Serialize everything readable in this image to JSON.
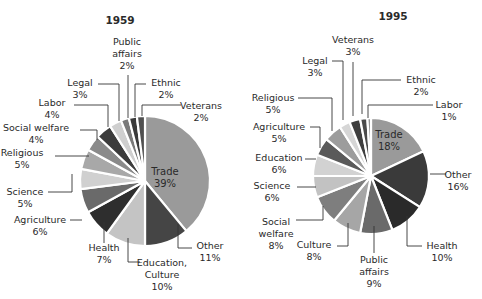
{
  "chart_data": [
    {
      "type": "pie",
      "title": "1959",
      "center": [
        145,
        181
      ],
      "radius": 65,
      "start_angle_deg": 0,
      "direction": "clockwise",
      "slices": [
        {
          "label": "Trade",
          "value": 39,
          "color": "#9a9a9a",
          "inside": true
        },
        {
          "label": "Other",
          "value": 11,
          "color": "#454545"
        },
        {
          "label": "Education, Culture",
          "value": 10,
          "color": "#c4c4c4"
        },
        {
          "label": "Health",
          "value": 7,
          "color": "#2e2e2e"
        },
        {
          "label": "Agriculture",
          "value": 6,
          "color": "#6a6a6a"
        },
        {
          "label": "Science",
          "value": 5,
          "color": "#d0d0d0"
        },
        {
          "label": "Religious",
          "value": 5,
          "color": "#a8a8a8"
        },
        {
          "label": "Social welfare",
          "value": 4,
          "color": "#8a8a8a"
        },
        {
          "label": "Labor",
          "value": 4,
          "color": "#3c3c3c"
        },
        {
          "label": "Legal",
          "value": 3,
          "color": "#cfcfcf"
        },
        {
          "label": "Public affairs",
          "value": 2,
          "color": "#7a7a7a"
        },
        {
          "label": "Ethnic",
          "value": 2,
          "color": "#3a3a3a"
        },
        {
          "label": "Veterans",
          "value": 2,
          "color": "#505050"
        }
      ],
      "labels": [
        {
          "text": [
            "Trade",
            "39%"
          ],
          "x": 165,
          "y": 175,
          "anchor": "middle",
          "inside": true
        },
        {
          "text": [
            "Other",
            "11%"
          ],
          "x": 210,
          "y": 249,
          "anchor": "middle",
          "line": [
            [
              192,
              248
            ],
            [
              178,
              248
            ],
            [
              178,
              224
            ]
          ]
        },
        {
          "text": [
            "Education,",
            "Culture",
            "10%"
          ],
          "x": 162,
          "y": 266,
          "anchor": "middle",
          "line": [
            [
              140,
              262
            ],
            [
              128,
              262
            ],
            [
              128,
              238
            ]
          ]
        },
        {
          "text": [
            "Health",
            "7%"
          ],
          "x": 104,
          "y": 251,
          "anchor": "middle",
          "line": [
            [
              104,
              243
            ],
            [
              104,
              222
            ]
          ]
        },
        {
          "text": [
            "Agriculture",
            "6%"
          ],
          "x": 40,
          "y": 223,
          "anchor": "middle",
          "line": [
            [
              70,
              220
            ],
            [
              82,
              220
            ]
          ]
        },
        {
          "text": [
            "Science",
            "5%"
          ],
          "x": 25,
          "y": 195,
          "anchor": "middle",
          "line": [
            [
              48,
              192
            ],
            [
              72,
              192
            ],
            [
              72,
              174
            ]
          ]
        },
        {
          "text": [
            "Religious",
            "5%"
          ],
          "x": 22,
          "y": 156,
          "anchor": "middle",
          "line": [
            [
              55,
              156
            ],
            [
              89,
              156
            ]
          ]
        },
        {
          "text": [
            "Social welfare",
            "4%"
          ],
          "x": 36,
          "y": 131,
          "anchor": "middle",
          "line": [
            [
              80,
              130
            ],
            [
              97,
              130
            ],
            [
              97,
              140
            ]
          ]
        },
        {
          "text": [
            "Labor",
            "4%"
          ],
          "x": 52,
          "y": 106,
          "anchor": "middle",
          "line": [
            [
              74,
              105
            ],
            [
              108,
              105
            ],
            [
              108,
              127
            ]
          ]
        },
        {
          "text": [
            "Legal",
            "3%"
          ],
          "x": 80,
          "y": 86,
          "anchor": "middle",
          "line": [
            [
              98,
              84
            ],
            [
              119,
              84
            ],
            [
              119,
              121
            ]
          ]
        },
        {
          "text": [
            "Public",
            "affairs",
            "2%"
          ],
          "x": 127,
          "y": 45,
          "anchor": "middle",
          "line": [
            [
              128,
              75
            ],
            [
              128,
              118
            ]
          ]
        },
        {
          "text": [
            "Ethnic",
            "2%"
          ],
          "x": 166,
          "y": 86,
          "anchor": "middle",
          "line": [
            [
              146,
              84
            ],
            [
              135,
              84
            ],
            [
              135,
              117
            ]
          ]
        },
        {
          "text": [
            "Veterans",
            "2%"
          ],
          "x": 201,
          "y": 109,
          "anchor": "middle",
          "line": [
            [
              181,
              105
            ],
            [
              142,
              105
            ],
            [
              142,
              116
            ]
          ]
        }
      ]
    },
    {
      "type": "pie",
      "title": "1995",
      "center": [
        371,
        176
      ],
      "radius": 58,
      "start_angle_deg": 0,
      "direction": "clockwise",
      "slices": [
        {
          "label": "Trade",
          "value": 18,
          "color": "#9a9a9a",
          "inside": true
        },
        {
          "label": "Other",
          "value": 16,
          "color": "#3a3a3a"
        },
        {
          "label": "Health",
          "value": 10,
          "color": "#2a2a2a"
        },
        {
          "label": "Public affairs",
          "value": 9,
          "color": "#6a6a6a"
        },
        {
          "label": "Culture",
          "value": 8,
          "color": "#a6a6a6"
        },
        {
          "label": "Social welfare",
          "value": 8,
          "color": "#7e7e7e"
        },
        {
          "label": "Science",
          "value": 6,
          "color": "#c2c2c2"
        },
        {
          "label": "Education",
          "value": 6,
          "color": "#d2d2d2"
        },
        {
          "label": "Agriculture",
          "value": 5,
          "color": "#5a5a5a"
        },
        {
          "label": "Religious",
          "value": 5,
          "color": "#9c9c9c"
        },
        {
          "label": "Legal",
          "value": 3,
          "color": "#d6d6d6"
        },
        {
          "label": "Veterans",
          "value": 3,
          "color": "#3e3e3e"
        },
        {
          "label": "Ethnic",
          "value": 2,
          "color": "#4a4a4a"
        },
        {
          "label": "Labor",
          "value": 1,
          "color": "#8a8a8a"
        }
      ],
      "labels": [
        {
          "text": [
            "Trade",
            "18%"
          ],
          "x": 389,
          "y": 138,
          "anchor": "middle",
          "inside": true
        },
        {
          "text": [
            "Other",
            "16%"
          ],
          "x": 458,
          "y": 178,
          "anchor": "middle",
          "line": [
            [
              446,
              174
            ],
            [
              430,
              174
            ]
          ]
        },
        {
          "text": [
            "Health",
            "10%"
          ],
          "x": 442,
          "y": 249,
          "anchor": "middle",
          "line": [
            [
              422,
              246
            ],
            [
              407,
              246
            ],
            [
              407,
              216
            ]
          ]
        },
        {
          "text": [
            "Public",
            "affairs",
            "9%"
          ],
          "x": 374,
          "y": 263,
          "anchor": "middle",
          "line": [
            [
              374,
              253
            ],
            [
              374,
              226
            ]
          ]
        },
        {
          "text": [
            "Culture",
            "8%"
          ],
          "x": 314,
          "y": 248,
          "anchor": "middle",
          "line": [
            [
              337,
              246
            ],
            [
              348,
              246
            ],
            [
              348,
              223
            ]
          ]
        },
        {
          "text": [
            "Social",
            "welfare",
            "8%"
          ],
          "x": 276,
          "y": 225,
          "anchor": "middle",
          "line": [
            [
              296,
              220
            ],
            [
              323,
              220
            ],
            [
              323,
              206
            ]
          ]
        },
        {
          "text": [
            "Science",
            "6%"
          ],
          "x": 272,
          "y": 189,
          "anchor": "middle",
          "line": [
            [
              297,
              187
            ],
            [
              316,
              187
            ]
          ]
        },
        {
          "text": [
            "Education",
            "6%"
          ],
          "x": 279,
          "y": 161,
          "anchor": "middle",
          "line": [
            [
              305,
              159
            ],
            [
              316,
              159
            ]
          ]
        },
        {
          "text": [
            "Agriculture",
            "5%"
          ],
          "x": 279,
          "y": 130,
          "anchor": "middle",
          "line": [
            [
              310,
              127
            ],
            [
              320,
              127
            ],
            [
              320,
              148
            ]
          ]
        },
        {
          "text": [
            "Religious",
            "5%"
          ],
          "x": 273,
          "y": 101,
          "anchor": "middle",
          "line": [
            [
              298,
              98
            ],
            [
              332,
              98
            ],
            [
              332,
              131
            ]
          ]
        },
        {
          "text": [
            "Legal",
            "3%"
          ],
          "x": 315,
          "y": 64,
          "anchor": "middle",
          "line": [
            [
              332,
              61
            ],
            [
              343,
              61
            ],
            [
              343,
              120
            ]
          ]
        },
        {
          "text": [
            "Veterans",
            "3%"
          ],
          "x": 353,
          "y": 43,
          "anchor": "middle",
          "line": [
            [
              353,
              62
            ],
            [
              353,
              116
            ]
          ]
        },
        {
          "text": [
            "Ethnic",
            "2%"
          ],
          "x": 421,
          "y": 83,
          "anchor": "middle",
          "line": [
            [
              401,
              80
            ],
            [
              362,
              80
            ],
            [
              362,
              114
            ]
          ]
        },
        {
          "text": [
            "Labor",
            "1%"
          ],
          "x": 449,
          "y": 108,
          "anchor": "middle",
          "line": [
            [
              433,
              105
            ],
            [
              368,
              105
            ],
            [
              368,
              118
            ]
          ]
        }
      ]
    }
  ],
  "titles": {
    "left": "1959",
    "right": "1995"
  },
  "title_positions": {
    "left": [
      120,
      24
    ],
    "right": [
      393,
      20
    ]
  }
}
